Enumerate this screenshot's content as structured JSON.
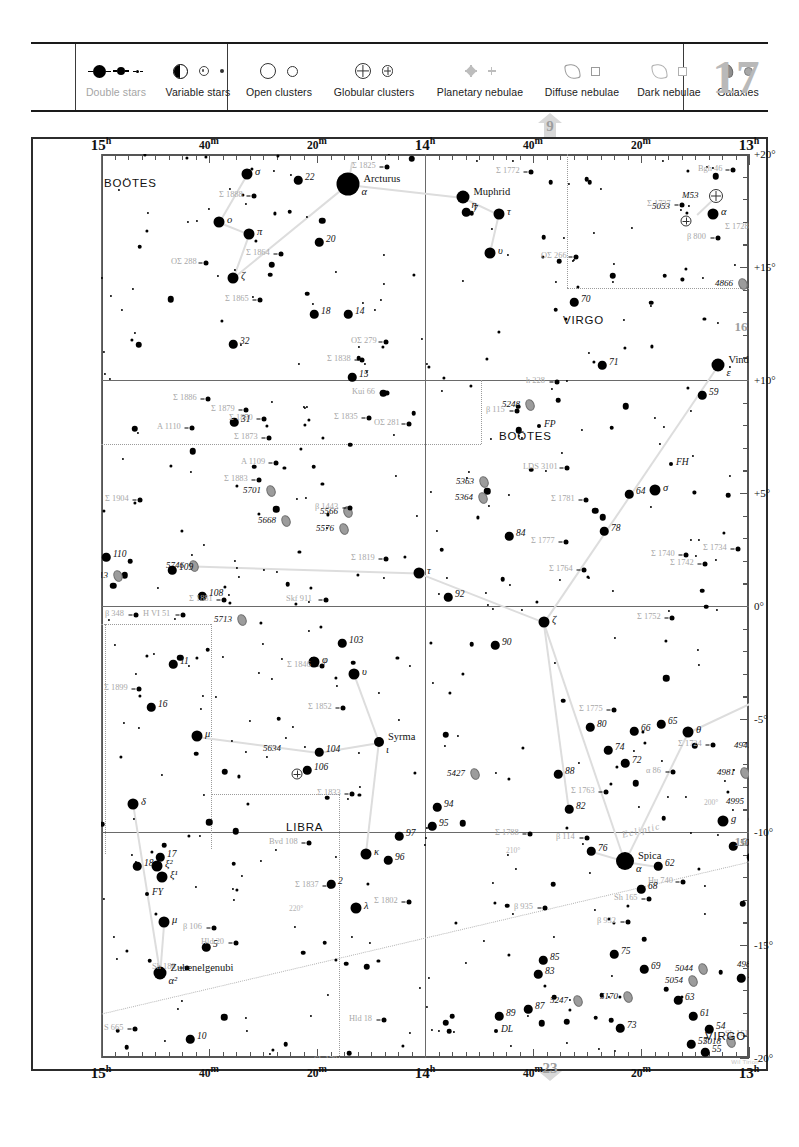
{
  "chart_data": {
    "type": "scatter",
    "chart_number": "17",
    "xlabel": "Right Ascension",
    "ylabel": "Declination",
    "xlim": [
      "15h",
      "13h"
    ],
    "ylim": [
      "-20°",
      "+20°"
    ],
    "grid": true,
    "legend_position": "top",
    "ra_ticks": [
      {
        "label": "15",
        "unit": "h",
        "major": true,
        "x": 0
      },
      {
        "label": "40",
        "unit": "m",
        "major": false,
        "x": 108
      },
      {
        "label": "20",
        "unit": "m",
        "major": false,
        "x": 216
      },
      {
        "label": "14",
        "unit": "h",
        "major": true,
        "x": 324
      },
      {
        "label": "40",
        "unit": "m",
        "major": false,
        "x": 432
      },
      {
        "label": "20",
        "unit": "m",
        "major": false,
        "x": 540
      },
      {
        "label": "13",
        "unit": "h",
        "major": true,
        "x": 648
      }
    ],
    "dec_ticks": [
      {
        "label": "+20°",
        "y": 0,
        "major": true
      },
      {
        "label": "+15°",
        "y": 113,
        "major": true
      },
      {
        "label": "+10°",
        "y": 226,
        "major": true
      },
      {
        "label": "+5°",
        "y": 339,
        "major": true
      },
      {
        "label": "0°",
        "y": 452,
        "major": true
      },
      {
        "label": "-5°",
        "y": 565,
        "major": true
      },
      {
        "label": "-10°",
        "y": 678,
        "major": true
      },
      {
        "label": "-15°",
        "y": 791,
        "major": true
      },
      {
        "label": "-20°",
        "y": 904,
        "major": true
      }
    ],
    "constellations": [
      {
        "name": "BOÖTES",
        "x": 3,
        "y": 23
      },
      {
        "name": "VIRGO",
        "x": 462,
        "y": 160
      },
      {
        "name": "BOÖTES",
        "x": 398,
        "y": 276
      },
      {
        "name": "LIBRA",
        "x": 185,
        "y": 667
      },
      {
        "name": "VIRGO",
        "x": 604,
        "y": 876
      }
    ],
    "named_stars": [
      {
        "name": "Arcturus",
        "bayer": "α",
        "x": 247,
        "y": 30,
        "mag": 0.0
      },
      {
        "name": "Muphrid",
        "bayer": "η",
        "x": 362,
        "y": 43,
        "mag": 2.7
      },
      {
        "name": "Vindemiatrix",
        "bayer": "ε",
        "x": 617,
        "y": 211,
        "mag": 2.8
      },
      {
        "name": "Spica",
        "bayer": "α",
        "x": 524,
        "y": 707,
        "mag": 1.0
      },
      {
        "name": "Syrma",
        "bayer": "ι",
        "x": 278,
        "y": 588,
        "mag": 4.1
      },
      {
        "name": "Zubenelgenubi",
        "bayer": "α²",
        "x": 59,
        "y": 819,
        "mag": 2.8
      }
    ],
    "greek_stars": [
      {
        "label": "σ",
        "x": 146,
        "y": 20
      },
      {
        "label": "ο",
        "x": 118,
        "y": 68
      },
      {
        "label": "π",
        "x": 148,
        "y": 80
      },
      {
        "label": "ζ",
        "x": 132,
        "y": 124
      },
      {
        "label": "τ",
        "x": 398,
        "y": 60
      },
      {
        "label": "υ",
        "x": 389,
        "y": 99
      },
      {
        "label": "α",
        "x": 612,
        "y": 60
      },
      {
        "label": "σ",
        "x": 554,
        "y": 336
      },
      {
        "label": "τ",
        "x": 318,
        "y": 419
      },
      {
        "label": "ζ",
        "x": 443,
        "y": 468
      },
      {
        "label": "φ",
        "x": 213,
        "y": 508
      },
      {
        "label": "υ",
        "x": 253,
        "y": 520
      },
      {
        "label": "μ",
        "x": 96,
        "y": 582
      },
      {
        "label": "θ",
        "x": 587,
        "y": 578
      },
      {
        "label": "κ",
        "x": 265,
        "y": 700
      },
      {
        "label": "δ",
        "x": 32,
        "y": 650
      },
      {
        "label": "λ",
        "x": 255,
        "y": 754
      },
      {
        "label": "μ",
        "x": 63,
        "y": 768
      },
      {
        "label": "ξ¹",
        "x": 61,
        "y": 723
      },
      {
        "label": "ξ²",
        "x": 56,
        "y": 712
      },
      {
        "label": "g",
        "x": 622,
        "y": 667
      }
    ],
    "flamsteed_stars": [
      {
        "n": "22",
        "x": 197,
        "y": 26
      },
      {
        "n": "20",
        "x": 218,
        "y": 88
      },
      {
        "n": "18",
        "x": 213,
        "y": 160
      },
      {
        "n": "14",
        "x": 247,
        "y": 160
      },
      {
        "n": "32",
        "x": 132,
        "y": 190
      },
      {
        "n": "15",
        "x": 251,
        "y": 223
      },
      {
        "n": "7",
        "x": 365,
        "y": 58
      },
      {
        "n": "70",
        "x": 473,
        "y": 148
      },
      {
        "n": "71",
        "x": 501,
        "y": 211
      },
      {
        "n": "36",
        "x": 700,
        "y": 62
      },
      {
        "n": "38",
        "x": 679,
        "y": 78
      },
      {
        "n": "59",
        "x": 601,
        "y": 241
      },
      {
        "n": "31",
        "x": 133,
        "y": 268
      },
      {
        "n": "110",
        "x": 5,
        "y": 403
      },
      {
        "n": "109",
        "x": 71,
        "y": 416
      },
      {
        "n": "108",
        "x": 101,
        "y": 442
      },
      {
        "n": "64",
        "x": 528,
        "y": 340
      },
      {
        "n": "84",
        "x": 408,
        "y": 382
      },
      {
        "n": "78",
        "x": 503,
        "y": 377
      },
      {
        "n": "92",
        "x": 347,
        "y": 443
      },
      {
        "n": "90",
        "x": 394,
        "y": 491
      },
      {
        "n": "11",
        "x": 72,
        "y": 510
      },
      {
        "n": "16",
        "x": 50,
        "y": 553
      },
      {
        "n": "103",
        "x": 241,
        "y": 489
      },
      {
        "n": "104",
        "x": 218,
        "y": 598
      },
      {
        "n": "106",
        "x": 206,
        "y": 616
      },
      {
        "n": "80",
        "x": 489,
        "y": 573
      },
      {
        "n": "66",
        "x": 533,
        "y": 577
      },
      {
        "n": "65",
        "x": 560,
        "y": 570
      },
      {
        "n": "74",
        "x": 507,
        "y": 596
      },
      {
        "n": "72",
        "x": 524,
        "y": 609
      },
      {
        "n": "88",
        "x": 457,
        "y": 620
      },
      {
        "n": "82",
        "x": 468,
        "y": 655
      },
      {
        "n": "46",
        "x": 689,
        "y": 530
      },
      {
        "n": "48",
        "x": 654,
        "y": 539
      },
      {
        "n": "44",
        "x": 679,
        "y": 543
      },
      {
        "n": "94",
        "x": 336,
        "y": 653
      },
      {
        "n": "95",
        "x": 331,
        "y": 672
      },
      {
        "n": "96",
        "x": 287,
        "y": 706
      },
      {
        "n": "97",
        "x": 298,
        "y": 682
      },
      {
        "n": "76",
        "x": 490,
        "y": 697
      },
      {
        "n": "50",
        "x": 632,
        "y": 692
      },
      {
        "n": "49",
        "x": 650,
        "y": 703
      },
      {
        "n": "62",
        "x": 557,
        "y": 712
      },
      {
        "n": "68",
        "x": 540,
        "y": 735
      },
      {
        "n": "17",
        "x": 59,
        "y": 703
      },
      {
        "n": "18",
        "x": 36,
        "y": 712
      },
      {
        "n": "2",
        "x": 230,
        "y": 730
      },
      {
        "n": "5",
        "x": 105,
        "y": 793
      },
      {
        "n": "10",
        "x": 89,
        "y": 885
      },
      {
        "n": "85",
        "x": 442,
        "y": 806
      },
      {
        "n": "83",
        "x": 437,
        "y": 820
      },
      {
        "n": "87",
        "x": 427,
        "y": 855
      },
      {
        "n": "89",
        "x": 398,
        "y": 862
      },
      {
        "n": "75",
        "x": 513,
        "y": 800
      },
      {
        "n": "69",
        "x": 543,
        "y": 815
      },
      {
        "n": "63",
        "x": 577,
        "y": 846
      },
      {
        "n": "61",
        "x": 592,
        "y": 862
      },
      {
        "n": "73",
        "x": 519,
        "y": 874
      },
      {
        "n": "53",
        "x": 640,
        "y": 824
      },
      {
        "n": "54",
        "x": 608,
        "y": 875
      },
      {
        "n": "57",
        "x": 590,
        "y": 890
      },
      {
        "n": "55",
        "x": 604,
        "y": 898
      },
      {
        "n": "9",
        "x": 652,
        "y": 665
      }
    ],
    "variables": [
      {
        "n": "FP",
        "x": 438,
        "y": 272
      },
      {
        "n": "FH",
        "x": 570,
        "y": 310
      },
      {
        "n": "FY",
        "x": 46,
        "y": 740
      },
      {
        "n": "DL",
        "x": 395,
        "y": 877
      }
    ],
    "galaxies": [
      {
        "n": "4866",
        "x": 642,
        "y": 130
      },
      {
        "n": "5248",
        "x": 429,
        "y": 251
      },
      {
        "n": "5363",
        "x": 383,
        "y": 328
      },
      {
        "n": "5364",
        "x": 382,
        "y": 344
      },
      {
        "n": "5701",
        "x": 170,
        "y": 337
      },
      {
        "n": "5668",
        "x": 185,
        "y": 367
      },
      {
        "n": "5566",
        "x": 247,
        "y": 358
      },
      {
        "n": "5576",
        "x": 243,
        "y": 375
      },
      {
        "n": "5746",
        "x": 93,
        "y": 412
      },
      {
        "n": "5813",
        "x": 17,
        "y": 422
      },
      {
        "n": "5713",
        "x": 141,
        "y": 466
      },
      {
        "n": "5427",
        "x": 374,
        "y": 620
      },
      {
        "n": "4941",
        "x": 661,
        "y": 592
      },
      {
        "n": "4981",
        "x": 644,
        "y": 619
      },
      {
        "n": "4995",
        "x": 653,
        "y": 648
      },
      {
        "n": "4958",
        "x": 677,
        "y": 641
      },
      {
        "n": "4939",
        "x": 677,
        "y": 698
      },
      {
        "n": "4902",
        "x": 678,
        "y": 781
      },
      {
        "n": "4856",
        "x": 682,
        "y": 794
      },
      {
        "n": "4984",
        "x": 664,
        "y": 811
      },
      {
        "n": "5044",
        "x": 602,
        "y": 815
      },
      {
        "n": "5054",
        "x": 592,
        "y": 827
      },
      {
        "n": "5247",
        "x": 477,
        "y": 847
      },
      {
        "n": "5170",
        "x": 527,
        "y": 843
      },
      {
        "n": "5018",
        "x": 630,
        "y": 888
      }
    ],
    "globular_clusters": [
      {
        "n": "M53",
        "x": 615,
        "y": 42
      },
      {
        "n": "5053",
        "x": 585,
        "y": 53
      },
      {
        "n": "5634",
        "x": 196,
        "y": 595
      }
    ],
    "doubles": [
      {
        "n": "Σ 1825",
        "x": 251,
        "y": 7
      },
      {
        "n": "Σ 1888",
        "x": 118,
        "y": 36
      },
      {
        "n": "Σ 1864",
        "x": 145,
        "y": 94
      },
      {
        "n": "OΣ 288",
        "x": 70,
        "y": 103
      },
      {
        "n": "Σ 1865",
        "x": 124,
        "y": 140
      },
      {
        "n": "OΣ 279",
        "x": 250,
        "y": 182
      },
      {
        "n": "Σ 1838",
        "x": 226,
        "y": 200
      },
      {
        "n": "Kui 66",
        "x": 251,
        "y": 233
      },
      {
        "n": "Σ 1886",
        "x": 72,
        "y": 239
      },
      {
        "n": "Σ 1879",
        "x": 110,
        "y": 250
      },
      {
        "n": "Σ 1870",
        "x": 128,
        "y": 259
      },
      {
        "n": "Σ 1873",
        "x": 133,
        "y": 278
      },
      {
        "n": "A 1110",
        "x": 56,
        "y": 268
      },
      {
        "n": "A 1109",
        "x": 140,
        "y": 303
      },
      {
        "n": "Σ 1883",
        "x": 123,
        "y": 320
      },
      {
        "n": "Σ 1835",
        "x": 233,
        "y": 258
      },
      {
        "n": "OΣ 281",
        "x": 273,
        "y": 264
      },
      {
        "n": "Σ 1904",
        "x": 4,
        "y": 340
      },
      {
        "n": "β 1443",
        "x": 214,
        "y": 348
      },
      {
        "n": "Σ 1819",
        "x": 250,
        "y": 399
      },
      {
        "n": "Σ 1881",
        "x": 88,
        "y": 440
      },
      {
        "n": "Skf 911",
        "x": 185,
        "y": 440
      },
      {
        "n": "β 348",
        "x": 4,
        "y": 455
      },
      {
        "n": "H VI 51",
        "x": 42,
        "y": 455
      },
      {
        "n": "Σ 1899",
        "x": 3,
        "y": 529
      },
      {
        "n": "Σ 1846",
        "x": 186,
        "y": 506
      },
      {
        "n": "Σ 1852",
        "x": 207,
        "y": 548
      },
      {
        "n": "Σ 1833",
        "x": 216,
        "y": 634
      },
      {
        "n": "Bvd 108",
        "x": 168,
        "y": 683
      },
      {
        "n": "Σ 1837",
        "x": 194,
        "y": 726
      },
      {
        "n": "Σ 1802",
        "x": 273,
        "y": 742
      },
      {
        "n": "β 106",
        "x": 82,
        "y": 768
      },
      {
        "n": "Hld 20",
        "x": 100,
        "y": 783
      },
      {
        "n": "Sh 186",
        "x": 51,
        "y": 808
      },
      {
        "n": "S 665",
        "x": 3,
        "y": 869
      },
      {
        "n": "Hld 18",
        "x": 248,
        "y": 860
      },
      {
        "n": "Sh 179",
        "x": 213,
        "y": 901
      },
      {
        "n": "Σ 1772",
        "x": 395,
        "y": 12
      },
      {
        "n": "Σ 1737",
        "x": 546,
        "y": 45
      },
      {
        "n": "Bgh 46",
        "x": 597,
        "y": 10
      },
      {
        "n": "Σ 1728",
        "x": 624,
        "y": 68
      },
      {
        "n": "β 800",
        "x": 586,
        "y": 78
      },
      {
        "n": "OΣ 266",
        "x": 440,
        "y": 97
      },
      {
        "n": "h 228",
        "x": 425,
        "y": 222
      },
      {
        "n": "β 115",
        "x": 385,
        "y": 251
      },
      {
        "n": "LDS 3101",
        "x": 422,
        "y": 308
      },
      {
        "n": "Σ 1781",
        "x": 450,
        "y": 340
      },
      {
        "n": "Σ 1777",
        "x": 430,
        "y": 382
      },
      {
        "n": "Σ 1740",
        "x": 550,
        "y": 395
      },
      {
        "n": "Σ 1734",
        "x": 602,
        "y": 389
      },
      {
        "n": "Σ 1764",
        "x": 448,
        "y": 410
      },
      {
        "n": "Σ 1742",
        "x": 569,
        "y": 404
      },
      {
        "n": "Σ 1719",
        "x": 655,
        "y": 437
      },
      {
        "n": "Σ 1752",
        "x": 536,
        "y": 458
      },
      {
        "n": "Σ 1775",
        "x": 478,
        "y": 550
      },
      {
        "n": "Σ 1731",
        "x": 648,
        "y": 548
      },
      {
        "n": "β 929",
        "x": 659,
        "y": 551
      },
      {
        "n": "Σ 1724",
        "x": 577,
        "y": 585
      },
      {
        "n": "Σ 1763",
        "x": 470,
        "y": 632
      },
      {
        "n": "Σ 1788",
        "x": 394,
        "y": 674
      },
      {
        "n": "β 114",
        "x": 455,
        "y": 678
      },
      {
        "n": "β 935",
        "x": 413,
        "y": 748
      },
      {
        "n": "Sh 165",
        "x": 513,
        "y": 739
      },
      {
        "n": "β 932",
        "x": 496,
        "y": 762
      },
      {
        "n": "Hu 740",
        "x": 547,
        "y": 722
      },
      {
        "n": "Sh 161",
        "x": 624,
        "y": 875
      },
      {
        "n": "Σ 1701",
        "x": 662,
        "y": 300
      },
      {
        "n": "α 86",
        "x": 545,
        "y": 612
      }
    ],
    "ecliptic_label": "Ecliptic",
    "ecliptic_degree_marks": [
      "200°",
      "210°",
      "220°"
    ]
  },
  "legend": {
    "items": [
      {
        "label": "Double stars",
        "icon": "double-star-icon",
        "faded": true
      },
      {
        "label": "Variable stars",
        "icon": "variable-star-icon",
        "faded": false
      },
      {
        "label": "Open clusters",
        "icon": "open-cluster-icon",
        "faded": false
      },
      {
        "label": "Globular clusters",
        "icon": "globular-cluster-icon",
        "faded": false
      },
      {
        "label": "Planetary nebulae",
        "icon": "planetary-nebula-icon",
        "faded": false
      },
      {
        "label": "Diffuse nebulae",
        "icon": "diffuse-nebula-icon",
        "faded": false
      },
      {
        "label": "Dark nebulae",
        "icon": "dark-nebula-icon",
        "faded": false
      },
      {
        "label": "Galaxies",
        "icon": "galaxy-icon",
        "faded": false
      }
    ],
    "chart_number": "17"
  },
  "page_links": {
    "top": "9",
    "bottom": "23",
    "right_upper": "16",
    "right_lower": "16"
  },
  "credit": "Wil Tirion"
}
